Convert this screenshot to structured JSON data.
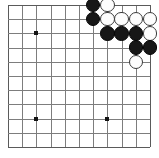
{
  "figure": {
    "board_label": "goban-grid",
    "width": 159,
    "height": 158
  },
  "board": {
    "columns": 11,
    "rows": 11,
    "origin_x": 8,
    "origin_y": 5,
    "spacing": 14.2,
    "line_color": "#7d7d7d",
    "edge_color": "#5a5a5a",
    "background_color": "#ffffff",
    "stone_radius": 7.2,
    "star_point_size": 4,
    "star_point_color": "#141414",
    "column_labels": [
      "1",
      "2",
      "3",
      "4",
      "5",
      "6",
      "7",
      "8",
      "9",
      "10",
      "11"
    ],
    "row_labels": [
      "1",
      "2",
      "3",
      "4",
      "5",
      "6",
      "7",
      "8",
      "9",
      "10",
      "11"
    ]
  },
  "star_points": [
    {
      "name": "star-point-left-upper",
      "col": 2,
      "row": 2
    },
    {
      "name": "star-point-left-lower",
      "col": 2,
      "row": 8
    },
    {
      "name": "star-point-center-lower",
      "col": 7,
      "row": 8
    }
  ],
  "stones": [
    {
      "name": "stone-black-1",
      "color": "black",
      "col": 6,
      "row": 0
    },
    {
      "name": "stone-white-1",
      "color": "white",
      "col": 7,
      "row": 0
    },
    {
      "name": "stone-black-2",
      "color": "black",
      "col": 6,
      "row": 1
    },
    {
      "name": "stone-white-2",
      "color": "white",
      "col": 7,
      "row": 1
    },
    {
      "name": "stone-white-3",
      "color": "white",
      "col": 8,
      "row": 1
    },
    {
      "name": "stone-white-4",
      "color": "white",
      "col": 9,
      "row": 1
    },
    {
      "name": "stone-white-5",
      "color": "white",
      "col": 10,
      "row": 1
    },
    {
      "name": "stone-black-3",
      "color": "black",
      "col": 7,
      "row": 2
    },
    {
      "name": "stone-black-4",
      "color": "black",
      "col": 8,
      "row": 2
    },
    {
      "name": "stone-black-5",
      "color": "black",
      "col": 9,
      "row": 2
    },
    {
      "name": "stone-white-6",
      "color": "white",
      "col": 10,
      "row": 2
    },
    {
      "name": "stone-black-6",
      "color": "black",
      "col": 9,
      "row": 3
    },
    {
      "name": "stone-black-7",
      "color": "black",
      "col": 10,
      "row": 3
    },
    {
      "name": "stone-white-7",
      "color": "white",
      "col": 9,
      "row": 4
    }
  ],
  "counts": {
    "black_stones": 7,
    "white_stones": 7,
    "total_stones": 14
  }
}
